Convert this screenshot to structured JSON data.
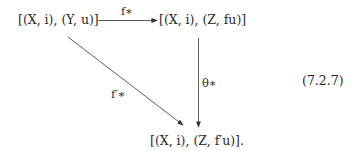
{
  "diagram": {
    "nodes": {
      "top_left": "[(X, i), (Y, u)]",
      "top_right": "[(X, i), (Z, fu)]",
      "bottom": "[(X, i), (Z, f′u)]."
    },
    "arrows": {
      "horizontal": {
        "from": "top_left",
        "to": "top_right",
        "label": "f∗"
      },
      "vertical": {
        "from": "top_right",
        "to": "bottom",
        "label": "θ∗"
      },
      "diagonal": {
        "from": "top_left",
        "to": "bottom",
        "label": "f′∗"
      }
    },
    "equation_number": "(7.2.7)"
  }
}
